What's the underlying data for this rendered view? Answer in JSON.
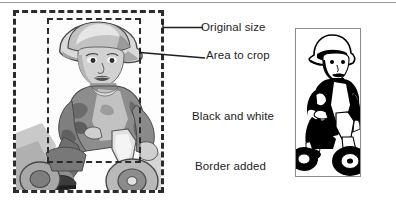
{
  "figure": {
    "title_rule": true,
    "background": "#ffffff",
    "ink": "#1d1d1d",
    "dash_color": "#2b2b2b",
    "rule_color": "#9a9a9a",
    "panel_border_color": "#8c8c8c"
  },
  "labels": {
    "original_size": "Original size",
    "area_to_crop": "Area to crop",
    "black_and_white": "Black and white",
    "border_added": "Border added"
  },
  "regions": {
    "outer_dashed_rect": {
      "x": 13,
      "y": 10,
      "width": 151,
      "height": 183
    },
    "inner_dashed_rect": {
      "x": 47,
      "y": 18,
      "width": 94,
      "height": 145
    },
    "bw_panel": {
      "x": 295,
      "y": 28,
      "width": 66,
      "height": 149
    }
  },
  "photo": {
    "subject": "child wearing a bucket hat riding a tricycle",
    "style": "posterized grayscale photograph"
  },
  "bw_image": {
    "subject": "child wearing a bucket hat riding a tricycle",
    "style": "high contrast black and white, thin border"
  }
}
